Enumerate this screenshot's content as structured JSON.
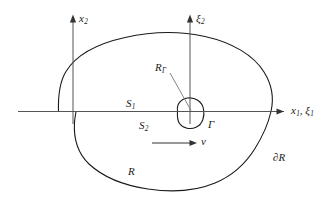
{
  "figure": {
    "kind": "mathematical-domain-diagram",
    "background_color": "#ffffff",
    "stroke_color": "#1a1a1a",
    "axis_color": "#555555",
    "leader_color": "#777777"
  },
  "labels": {
    "x2_axis": {
      "base": "x",
      "sub": "2"
    },
    "xi2_axis": {
      "base": "ξ",
      "sub": "2"
    },
    "x1_xi1_axis": {
      "base1": "x",
      "sub1": "1",
      "comma": ", ",
      "base2": "ξ",
      "sub2": "1"
    },
    "surface_upper": {
      "base": "S",
      "sub": "1"
    },
    "surface_lower": {
      "base": "S",
      "sub": "2"
    },
    "crack_radius": {
      "base": "R",
      "sub": "Γ"
    },
    "crack_contour": {
      "text": "Γ"
    },
    "velocity": {
      "text": "v"
    },
    "region": {
      "text": "R"
    },
    "region_boundary": {
      "text": "∂R"
    }
  },
  "geometry": {
    "horizontal_axis": {
      "x_start": 18,
      "x_end": 286,
      "y": 111,
      "arrow": "right"
    },
    "x2_axis": {
      "x": 73,
      "y_top": 16,
      "y_bottom": 124,
      "arrow": "up"
    },
    "xi2_axis": {
      "x": 190,
      "y_top": 16,
      "y_bottom": 124,
      "arrow": "up"
    },
    "velocity_arrow": {
      "x_start": 152,
      "x_end": 196,
      "y": 143,
      "arrow": "right"
    },
    "crack_center": {
      "x": 190,
      "y": 112
    },
    "crack_radius_px": 14,
    "leader_line": {
      "x_start": 170,
      "y_start": 73,
      "x_end": 191,
      "y_end": 110
    }
  }
}
